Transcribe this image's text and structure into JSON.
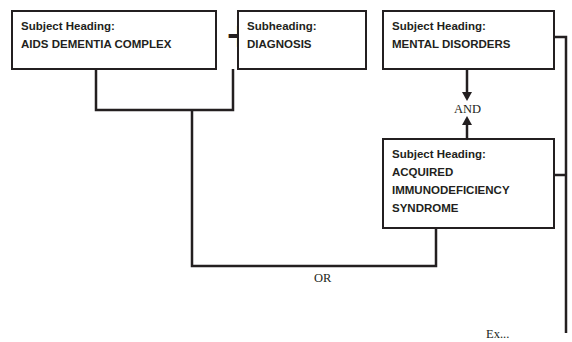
{
  "boxes": {
    "aids_dementia": {
      "label": "Subject Heading:",
      "value": "AIDS DEMENTIA COMPLEX"
    },
    "diagnosis": {
      "label": "Subheading:",
      "value": "DIAGNOSIS"
    },
    "mental_disorders": {
      "label": "Subject Heading:",
      "value": "MENTAL DISORDERS"
    },
    "aids": {
      "label": "Subject Heading:",
      "lines": [
        "ACQUIRED",
        "IMMUNODEFICIENCY",
        "SYNDROME"
      ]
    }
  },
  "operators": {
    "plus": "+",
    "and": "AND",
    "or": "OR"
  },
  "truncated_text": "Ex..."
}
